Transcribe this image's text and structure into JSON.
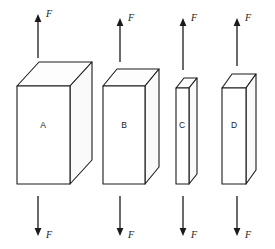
{
  "figure": {
    "background_color": "#ffffff",
    "line_color": "#1a1a1a",
    "face_fill": "#ffffff",
    "width": 275,
    "height": 249
  },
  "blocks": [
    {
      "label": "A",
      "label_x": 43,
      "label_y": 126,
      "front": {
        "x": 17,
        "y": 86,
        "w": 53,
        "h": 98
      },
      "depth_dx": 22,
      "depth_dy": -24
    },
    {
      "label": "B",
      "label_x": 124,
      "label_y": 126,
      "front": {
        "x": 103,
        "y": 86,
        "w": 42,
        "h": 98
      },
      "depth_dx": 14,
      "depth_dy": -17
    },
    {
      "label": "C",
      "label_x": 182,
      "label_y": 126,
      "front": {
        "x": 176,
        "y": 88,
        "w": 13,
        "h": 96
      },
      "depth_dx": 8,
      "depth_dy": -10
    },
    {
      "label": "D",
      "label_x": 234,
      "label_y": 126,
      "front": {
        "x": 222,
        "y": 88,
        "w": 24,
        "h": 96
      },
      "depth_dx": 10,
      "depth_dy": -14
    }
  ],
  "arrows": [
    {
      "group": "A",
      "direction": "up",
      "x": 38,
      "y_tail": 58,
      "y_tip": 14,
      "force_label": "F",
      "label_x": 46,
      "label_y": 15
    },
    {
      "group": "A",
      "direction": "down",
      "x": 38,
      "y_tail": 196,
      "y_tip": 236,
      "force_label": "F",
      "label_x": 46,
      "label_y": 236
    },
    {
      "group": "B",
      "direction": "up",
      "x": 120,
      "y_tail": 62,
      "y_tip": 18,
      "force_label": "F",
      "label_x": 128,
      "label_y": 19
    },
    {
      "group": "B",
      "direction": "down",
      "x": 120,
      "y_tail": 196,
      "y_tip": 236,
      "force_label": "F",
      "label_x": 128,
      "label_y": 236
    },
    {
      "group": "C",
      "direction": "up",
      "x": 183,
      "y_tail": 70,
      "y_tip": 18,
      "force_label": "F",
      "label_x": 191,
      "label_y": 19
    },
    {
      "group": "C",
      "direction": "down",
      "x": 183,
      "y_tail": 196,
      "y_tip": 236,
      "force_label": "F",
      "label_x": 191,
      "label_y": 236
    },
    {
      "group": "D",
      "direction": "up",
      "x": 237,
      "y_tail": 66,
      "y_tip": 18,
      "force_label": "F",
      "label_x": 245,
      "label_y": 19
    },
    {
      "group": "D",
      "direction": "down",
      "x": 237,
      "y_tail": 196,
      "y_tip": 236,
      "force_label": "F",
      "label_x": 245,
      "label_y": 236
    }
  ]
}
